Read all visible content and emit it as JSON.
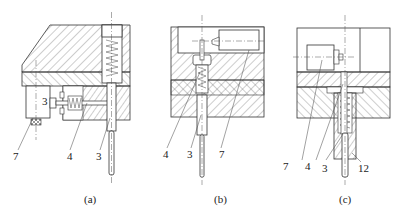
{
  "figure": {
    "type": "mechanical section drawing",
    "subfigures": [
      {
        "id": "a",
        "caption": "(a)",
        "labels": [
          {
            "text": "3",
            "role": "inside-block"
          },
          {
            "text": "7",
            "role": "leader"
          },
          {
            "text": "4",
            "role": "leader"
          },
          {
            "text": "3",
            "role": "leader"
          }
        ]
      },
      {
        "id": "b",
        "caption": "(b)",
        "labels": [
          {
            "text": "4",
            "role": "leader"
          },
          {
            "text": "3",
            "role": "leader"
          },
          {
            "text": "7",
            "role": "leader"
          }
        ]
      },
      {
        "id": "c",
        "caption": "(c)",
        "labels": [
          {
            "text": "7",
            "role": "leader"
          },
          {
            "text": "4",
            "role": "leader"
          },
          {
            "text": "3",
            "role": "leader"
          },
          {
            "text": "12",
            "role": "leader"
          }
        ]
      }
    ],
    "colors": {
      "line": "#333333",
      "background": "#ffffff"
    }
  }
}
